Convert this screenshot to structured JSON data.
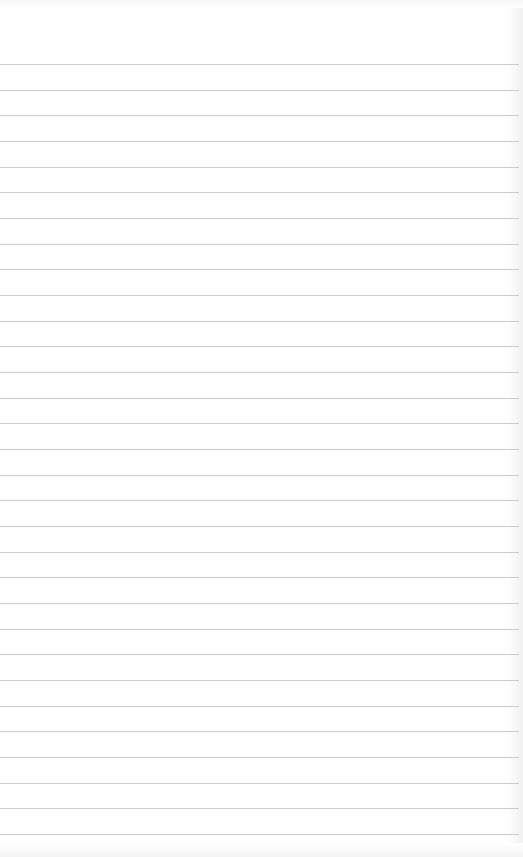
{
  "paper": {
    "type": "ruled-notepad",
    "background_color": "#ffffff",
    "line_color": "#b9b9b9",
    "line_count": 31,
    "first_line_y": 64,
    "line_spacing": 25.67
  }
}
